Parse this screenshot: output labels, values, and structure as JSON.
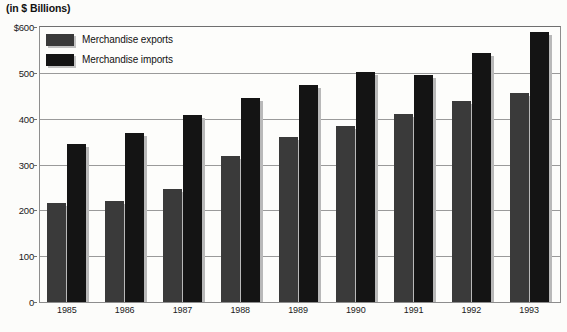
{
  "chart_data": {
    "type": "bar",
    "title": "(in $ Billions)",
    "xlabel": "",
    "ylabel": "",
    "categories": [
      "1985",
      "1986",
      "1987",
      "1988",
      "1989",
      "1990",
      "1991",
      "1992",
      "1993"
    ],
    "series": [
      {
        "name": "Merchandise exports",
        "color": "#3a3a3a",
        "values": [
          216,
          221,
          247,
          318,
          361,
          385,
          411,
          439,
          457
        ]
      },
      {
        "name": "Merchandise imports",
        "color": "#141414",
        "values": [
          344,
          368,
          409,
          446,
          474,
          502,
          495,
          543,
          590
        ]
      }
    ],
    "ylim": [
      0,
      600
    ],
    "yticks": [
      {
        "value": 600,
        "label": "$600"
      },
      {
        "value": 500,
        "label": "500"
      },
      {
        "value": 400,
        "label": "400"
      },
      {
        "value": 300,
        "label": "300"
      },
      {
        "value": 200,
        "label": "200"
      },
      {
        "value": 100,
        "label": "100"
      },
      {
        "value": 0,
        "label": "0"
      }
    ],
    "grid": true,
    "legend_position": "top-left"
  },
  "legend": {
    "items": [
      {
        "label": "Merchandise exports",
        "color": "#3a3a3a"
      },
      {
        "label": "Merchandise imports",
        "color": "#141414"
      }
    ]
  }
}
